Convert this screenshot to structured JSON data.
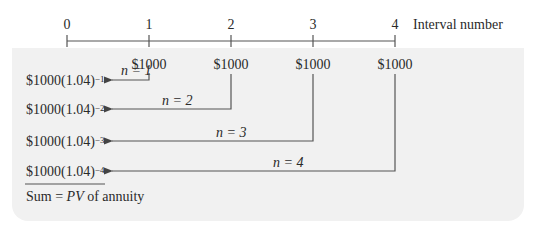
{
  "timeline": {
    "axis_label": "Interval number",
    "ticks": [
      "0",
      "1",
      "2",
      "3",
      "4"
    ],
    "payments": [
      "$1000",
      "$1000",
      "$1000",
      "$1000"
    ]
  },
  "terms": [
    {
      "base": "$1000(1.04)",
      "exp": "−1",
      "n_label": "n = 1"
    },
    {
      "base": "$1000(1.04)",
      "exp": "−2",
      "n_label": "n = 2"
    },
    {
      "base": "$1000(1.04)",
      "exp": "−3",
      "n_label": "n = 3"
    },
    {
      "base": "$1000(1.04)",
      "exp": "−4",
      "n_label": "n = 4"
    }
  ],
  "sum": {
    "prefix": "Sum = ",
    "pv": "PV",
    "suffix": " of annuity"
  },
  "colors": {
    "panel": "#f1f1f1",
    "line": "#555555",
    "text": "#2a2a2a"
  }
}
